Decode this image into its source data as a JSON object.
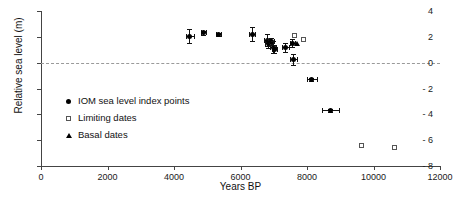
{
  "chart_data": {
    "type": "scatter",
    "title": "",
    "xlabel": "Years BP",
    "ylabel": "Relative sea level (m)",
    "xlim": [
      0,
      12000
    ],
    "ylim": [
      -8,
      4
    ],
    "xticks": [
      0,
      2000,
      4000,
      6000,
      8000,
      10000,
      12000
    ],
    "yticks": [
      4,
      2,
      0,
      -2,
      -4,
      -6,
      -8
    ],
    "xtick_labels": [
      "0",
      "2000",
      "4000",
      "6000",
      "8000",
      "10000",
      "12000"
    ],
    "ytick_labels": [
      "4",
      "2",
      "0",
      "- 2",
      "- 4",
      "- 6",
      "- 8"
    ],
    "grid": false,
    "zero_line": true,
    "legend_position": "inside-left",
    "series": [
      {
        "name": "IOM sea level index points",
        "marker": "filled-circle",
        "color": "#000000",
        "points": [
          {
            "x": 4480,
            "y": 2.05,
            "xerr": 110,
            "yerr": 0.55
          },
          {
            "x": 4880,
            "y": 2.3,
            "xerr": 70,
            "yerr": 0.18
          },
          {
            "x": 5330,
            "y": 2.15,
            "xerr": 70,
            "yerr": 0.12
          },
          {
            "x": 6350,
            "y": 2.2,
            "xerr": 80,
            "yerr": 0.55
          },
          {
            "x": 6800,
            "y": 1.75,
            "xerr": 90,
            "yerr": 0.45
          },
          {
            "x": 6840,
            "y": 1.5,
            "xerr": 100,
            "yerr": 0.35
          },
          {
            "x": 6930,
            "y": 1.65,
            "xerr": 70,
            "yerr": 0.25
          },
          {
            "x": 6980,
            "y": 1.2,
            "xerr": 90,
            "yerr": 0.45
          },
          {
            "x": 7030,
            "y": 1.05,
            "xerr": 70,
            "yerr": 0.3
          },
          {
            "x": 7350,
            "y": 1.2,
            "xerr": 110,
            "yerr": 0.35
          },
          {
            "x": 7560,
            "y": 1.5,
            "xerr": 70,
            "yerr": 0.3
          },
          {
            "x": 7600,
            "y": 0.25,
            "xerr": 110,
            "yerr": 0.45
          },
          {
            "x": 8150,
            "y": -1.3,
            "xerr": 150,
            "yerr": 0.15
          },
          {
            "x": 8700,
            "y": -3.7,
            "xerr": 260,
            "yerr": 0.15
          }
        ]
      },
      {
        "name": "Limiting dates",
        "marker": "open-square",
        "color": "#555555",
        "points": [
          {
            "x": 7620,
            "y": 2.1
          },
          {
            "x": 7880,
            "y": 1.8
          },
          {
            "x": 9650,
            "y": -6.4
          },
          {
            "x": 10620,
            "y": -6.6
          }
        ]
      },
      {
        "name": "Basal dates",
        "marker": "filled-triangle",
        "color": "#000000",
        "points": [
          {
            "x": 7690,
            "y": 1.45
          }
        ]
      }
    ]
  },
  "legend": {
    "items": [
      {
        "label": "IOM sea level index points",
        "marker": "filled-circle"
      },
      {
        "label": "Limiting dates",
        "marker": "open-square"
      },
      {
        "label": "Basal dates",
        "marker": "filled-triangle"
      }
    ]
  }
}
